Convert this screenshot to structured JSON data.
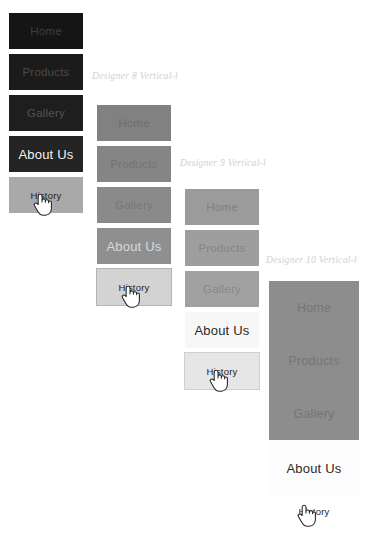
{
  "page": {
    "background": "#ffffff",
    "width": 368,
    "height": 533
  },
  "menu_items": [
    "Home",
    "Products",
    "Gallery",
    "About Us",
    "History"
  ],
  "groups": [
    {
      "id": "group-1",
      "caption": "",
      "style": "dark",
      "base_color": "#1b1b1b",
      "highlight_color": "#a9a9a9",
      "items": [
        {
          "label": "Home",
          "state": "normal"
        },
        {
          "label": "Products",
          "state": "normal"
        },
        {
          "label": "Gallery",
          "state": "normal"
        },
        {
          "label": "About Us",
          "state": "active"
        },
        {
          "label": "History",
          "state": "hover"
        }
      ]
    },
    {
      "id": "group-2",
      "caption": "Designer 8 Vertical-l",
      "style": "medium-gray",
      "base_color": "#858585",
      "highlight_color": "#d3d3d3",
      "items": [
        {
          "label": "Home",
          "state": "normal"
        },
        {
          "label": "Products",
          "state": "normal"
        },
        {
          "label": "Gallery",
          "state": "normal"
        },
        {
          "label": "About Us",
          "state": "active"
        },
        {
          "label": "History",
          "state": "hover"
        }
      ]
    },
    {
      "id": "group-3",
      "caption": "Designer 9 Vertical-l",
      "style": "light-gray",
      "base_color": "#9e9e9e",
      "highlight_color": "#f7f7f7",
      "items": [
        {
          "label": "Home",
          "state": "normal"
        },
        {
          "label": "Products",
          "state": "normal"
        },
        {
          "label": "Gallery",
          "state": "normal"
        },
        {
          "label": "About Us",
          "state": "active"
        },
        {
          "label": "History",
          "state": "hover"
        }
      ]
    },
    {
      "id": "group-4",
      "caption": "Designer 10 Vertical-l",
      "style": "tall-seamless",
      "base_color": "#8d8d8d",
      "highlight_color": "#ffffff",
      "items": [
        {
          "label": "Home",
          "state": "normal"
        },
        {
          "label": "Products",
          "state": "normal"
        },
        {
          "label": "Gallery",
          "state": "normal"
        },
        {
          "label": "About Us",
          "state": "active"
        },
        {
          "label": "History",
          "state": "hover"
        }
      ]
    }
  ],
  "cursors": [
    {
      "type": "pointing-hand",
      "over_item": "History",
      "group": "group-1"
    },
    {
      "type": "pointing-hand",
      "over_item": "History",
      "group": "group-2"
    },
    {
      "type": "pointing-hand",
      "over_item": "History",
      "group": "group-3"
    },
    {
      "type": "pointing-hand",
      "over_item": "History",
      "group": "group-4"
    }
  ]
}
